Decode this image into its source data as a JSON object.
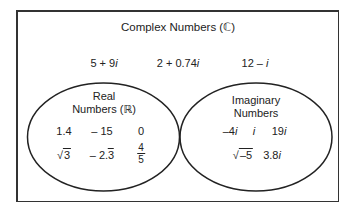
{
  "title": "Complex Numbers (ℂ)",
  "complex_only": [
    "5 + 9i",
    "2 + 0.74i",
    "12 – i"
  ],
  "real": {
    "label_line1": "Real",
    "label_line2": "Numbers (ℝ)",
    "row1": [
      "1.4",
      "– 15",
      "0"
    ],
    "row2": [
      "√3",
      "– 2.3̄",
      "4/5"
    ]
  },
  "imaginary": {
    "label_line1": "Imaginary",
    "label_line2": "Numbers",
    "row1": [
      "–4i",
      "i",
      "19i"
    ],
    "row2": [
      "√–5",
      "3.8i"
    ]
  },
  "colors": {
    "stroke": "#222222",
    "background": "#ffffff"
  }
}
